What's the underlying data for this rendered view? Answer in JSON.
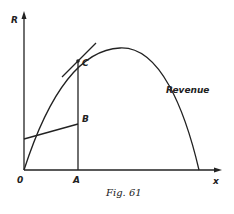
{
  "figure": {
    "caption": "Fig. 61",
    "y_axis_label": "R",
    "x_axis_label": "x",
    "origin_label": "0",
    "point_labels": {
      "A": "A",
      "B": "B",
      "C": "C"
    },
    "curve_label": "Revenue"
  },
  "colors": {
    "ink": "#222222",
    "background": "#ffffff"
  }
}
